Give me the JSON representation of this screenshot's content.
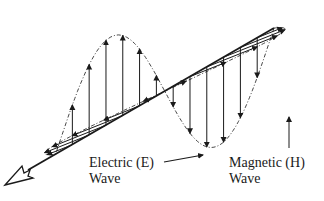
{
  "diagram": {
    "colors": {
      "ink": "#1a1a1a",
      "background": "#ffffff"
    },
    "axis": {
      "start": [
        274,
        28
      ],
      "end": [
        20,
        175
      ],
      "arrowhead": "hollow"
    },
    "electric_wave": {
      "label_line1": "Electric (E)",
      "label_line2": "Wave",
      "plane": "vertical",
      "amplitude": 95,
      "arrow_count": 13
    },
    "magnetic_wave": {
      "label_line1": "Magnetic (H)",
      "label_line2": "Wave",
      "plane": "horizontal",
      "amplitude": 58,
      "arrow_count": 13
    }
  }
}
